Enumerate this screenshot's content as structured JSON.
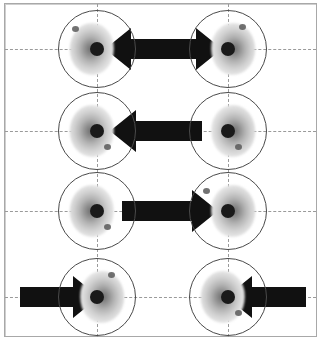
{
  "figure": {
    "type": "scientific-diagram",
    "title": "",
    "width": 330,
    "height": 342,
    "background_color": "#ffffff",
    "frame": {
      "border_color": "#a8a8a8",
      "x": 4,
      "y": 3,
      "width": 313,
      "height": 334
    },
    "gridlines": {
      "style": "dashed",
      "color": "#9a9a9a",
      "horizontal_y": [
        49,
        131,
        211,
        297
      ],
      "vertical_x": [
        97,
        228
      ]
    },
    "particle_style": {
      "ring_color": "#4a4a4a",
      "ring_diameter": 78,
      "core_color": "#1a1a1a",
      "core_diameter": 14,
      "blob_color_center": "#6e6e6e",
      "blob_color_edge": "#f5f5f5"
    },
    "arrow_color": "#111111",
    "rows": [
      {
        "index": 1,
        "center_y": 49,
        "label": "row-1-double-outward",
        "particles": [
          {
            "cx": 97,
            "cy": 49,
            "blob_side": "left",
            "speck": "up-left"
          },
          {
            "cx": 228,
            "cy": 49,
            "blob_side": "right",
            "speck": "up-right"
          }
        ],
        "arrows": [
          {
            "name": "double-headed-arrow",
            "direction": "both",
            "x_start": 105,
            "x_end": 222,
            "thickness": 20
          }
        ]
      },
      {
        "index": 2,
        "center_y": 131,
        "label": "row-2-single-left",
        "particles": [
          {
            "cx": 97,
            "cy": 131,
            "blob_side": "left",
            "speck": "low-right"
          },
          {
            "cx": 228,
            "cy": 131,
            "blob_side": "right",
            "speck": "low-right"
          }
        ],
        "arrows": [
          {
            "name": "left-arrow",
            "direction": "left",
            "x_start": 202,
            "x_end": 110,
            "thickness": 20
          }
        ]
      },
      {
        "index": 3,
        "center_y": 211,
        "label": "row-3-single-right",
        "particles": [
          {
            "cx": 97,
            "cy": 211,
            "blob_side": "left",
            "speck": "low-right"
          },
          {
            "cx": 228,
            "cy": 211,
            "blob_side": "right",
            "speck": "up-left"
          }
        ],
        "arrows": [
          {
            "name": "right-arrow",
            "direction": "right",
            "x_start": 122,
            "x_end": 218,
            "thickness": 20
          }
        ]
      },
      {
        "index": 4,
        "center_y": 297,
        "label": "row-4-two-inward",
        "particles": [
          {
            "cx": 97,
            "cy": 297,
            "blob_side": "right",
            "speck": "up-right"
          },
          {
            "cx": 228,
            "cy": 297,
            "blob_side": "left",
            "speck": "low-right"
          }
        ],
        "arrows": [
          {
            "name": "inward-right-arrow",
            "direction": "right",
            "x_start": 20,
            "x_end": 99,
            "thickness": 20
          },
          {
            "name": "inward-left-arrow",
            "direction": "left",
            "x_start": 306,
            "x_end": 226,
            "thickness": 20
          }
        ]
      }
    ]
  }
}
